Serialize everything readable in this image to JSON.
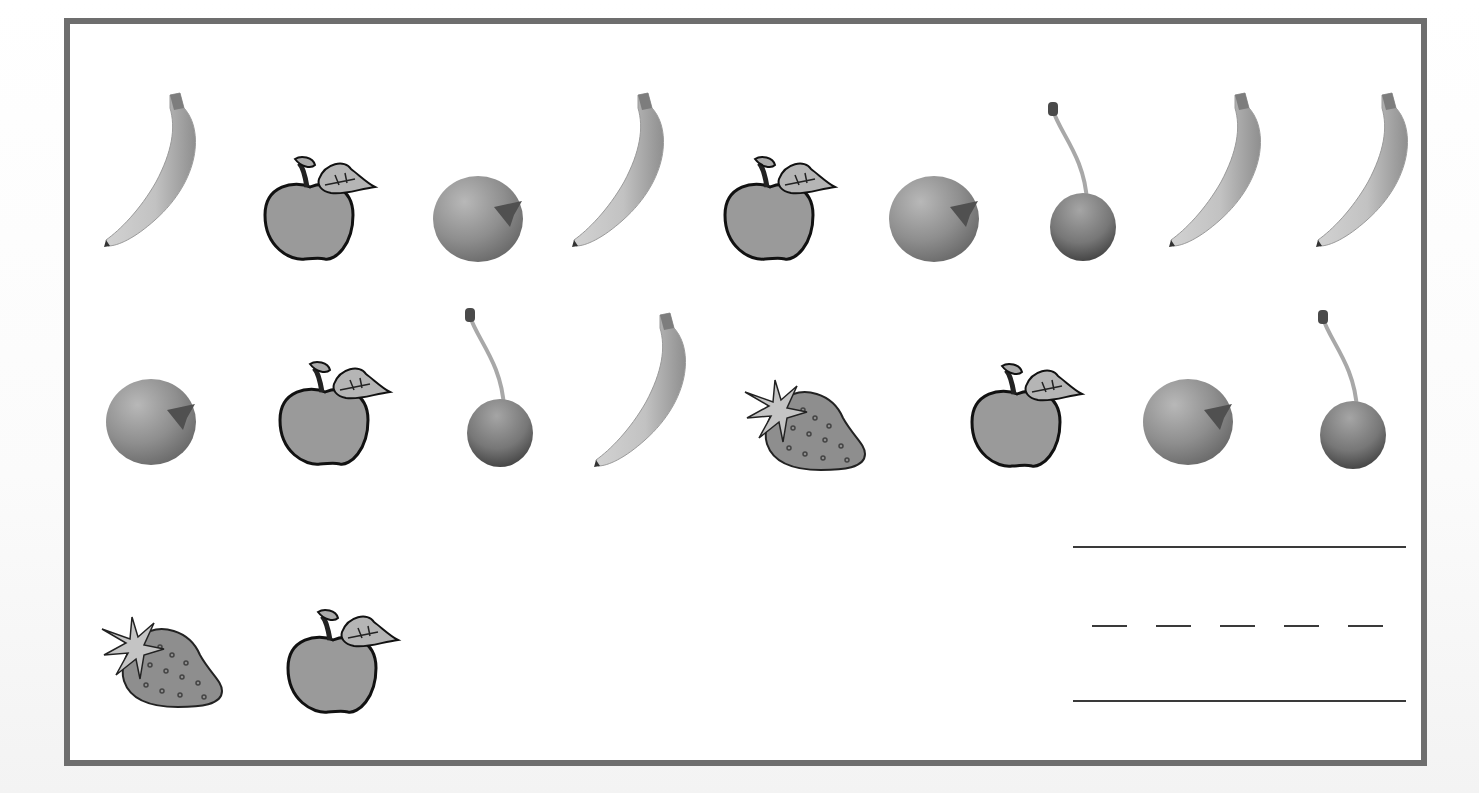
{
  "worksheet": {
    "title": "",
    "frame_color": "#6e6e6e",
    "ink_color": "#3a3a3a",
    "rows": [
      {
        "id": "row-1",
        "items": [
          {
            "type": "banana",
            "x": 100,
            "y": 90
          },
          {
            "type": "apple",
            "x": 255,
            "y": 155
          },
          {
            "type": "orange",
            "x": 432,
            "y": 175
          },
          {
            "type": "banana",
            "x": 568,
            "y": 90
          },
          {
            "type": "apple",
            "x": 715,
            "y": 155
          },
          {
            "type": "orange",
            "x": 888,
            "y": 175
          },
          {
            "type": "cherry",
            "x": 1045,
            "y": 102
          },
          {
            "type": "banana",
            "x": 1165,
            "y": 90
          },
          {
            "type": "banana",
            "x": 1312,
            "y": 90
          }
        ]
      },
      {
        "id": "row-2",
        "items": [
          {
            "type": "orange",
            "x": 105,
            "y": 378
          },
          {
            "type": "apple",
            "x": 270,
            "y": 360
          },
          {
            "type": "cherry",
            "x": 462,
            "y": 308
          },
          {
            "type": "banana",
            "x": 590,
            "y": 310
          },
          {
            "type": "strawberry",
            "x": 743,
            "y": 378
          },
          {
            "type": "apple",
            "x": 962,
            "y": 362
          },
          {
            "type": "orange",
            "x": 1142,
            "y": 378
          },
          {
            "type": "cherry",
            "x": 1315,
            "y": 310
          }
        ]
      },
      {
        "id": "row-3",
        "items": [
          {
            "type": "strawberry",
            "x": 100,
            "y": 615
          },
          {
            "type": "apple",
            "x": 278,
            "y": 608
          }
        ]
      }
    ],
    "counts": {
      "banana": 5,
      "apple": 5,
      "orange": 4,
      "cherry": 3,
      "strawberry": 2
    },
    "writing_lines": {
      "top_solid": {
        "x": 1073,
        "y": 546,
        "width": 333
      },
      "middle_dashed": {
        "x": 1092,
        "y": 625,
        "dash_count": 5,
        "dash_width": 35,
        "gap": 29
      },
      "bottom_solid": {
        "x": 1073,
        "y": 700,
        "width": 333
      }
    }
  }
}
